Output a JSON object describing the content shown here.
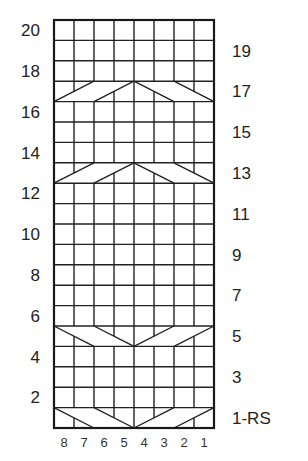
{
  "chart_data": {
    "type": "knitting-cable-chart",
    "columns": 8,
    "rows": 20,
    "column_labels": [
      "8",
      "7",
      "6",
      "5",
      "4",
      "3",
      "2",
      "1"
    ],
    "left_row_labels": [
      "20",
      "18",
      "16",
      "14",
      "12",
      "10",
      "8",
      "6",
      "4",
      "2"
    ],
    "right_row_labels": [
      "19",
      "17",
      "15",
      "13",
      "11",
      "9",
      "7",
      "5",
      "3",
      "1-RS"
    ],
    "cable_rows": [
      {
        "row": 1,
        "shape": "V"
      },
      {
        "row": 5,
        "shape": "V"
      },
      {
        "row": 13,
        "shape": "inverted-V"
      },
      {
        "row": 17,
        "shape": "inverted-V"
      }
    ],
    "line_color": "#222222",
    "background": "#ffffff"
  }
}
